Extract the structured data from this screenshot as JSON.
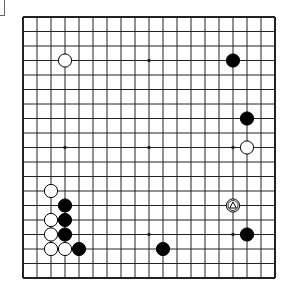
{
  "board": {
    "size": 19,
    "origin_x": 23,
    "origin_y": 17,
    "step_x": 14,
    "step_y": 14.5,
    "line_color": "#222222",
    "background": "#ffffff",
    "hoshi": [
      [
        3,
        3
      ],
      [
        9,
        3
      ],
      [
        15,
        3
      ],
      [
        3,
        9
      ],
      [
        9,
        9
      ],
      [
        15,
        9
      ],
      [
        3,
        15
      ],
      [
        9,
        15
      ],
      [
        15,
        15
      ]
    ],
    "stones": [
      {
        "color": "white",
        "col": 3,
        "row": 3
      },
      {
        "color": "black",
        "col": 15,
        "row": 3
      },
      {
        "color": "black",
        "col": 16,
        "row": 7
      },
      {
        "color": "white",
        "col": 16,
        "row": 9
      },
      {
        "color": "white",
        "col": 2,
        "row": 12
      },
      {
        "color": "black",
        "col": 3,
        "row": 13
      },
      {
        "color": "white",
        "col": 15,
        "row": 13,
        "marker": "triangle"
      },
      {
        "color": "white",
        "col": 2,
        "row": 14
      },
      {
        "color": "black",
        "col": 3,
        "row": 14
      },
      {
        "color": "white",
        "col": 2,
        "row": 15
      },
      {
        "color": "black",
        "col": 3,
        "row": 15
      },
      {
        "color": "black",
        "col": 16,
        "row": 15
      },
      {
        "color": "white",
        "col": 2,
        "row": 16
      },
      {
        "color": "white",
        "col": 3,
        "row": 16
      },
      {
        "color": "black",
        "col": 4,
        "row": 16
      },
      {
        "color": "black",
        "col": 10,
        "row": 16
      }
    ]
  }
}
